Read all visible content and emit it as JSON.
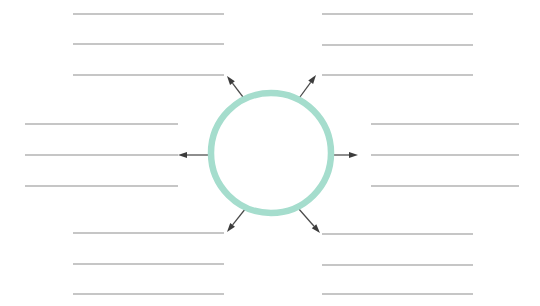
{
  "worksheet": {
    "title": "Blank radial brainstorming worksheet",
    "width": 540,
    "height": 306,
    "background_color": "#ffffff"
  },
  "center": {
    "shape_name": "center-circle",
    "cx": 271,
    "cy": 153,
    "r": 60,
    "stroke_color": "#a5ddcd",
    "stroke_width": 6.5,
    "fill": "none",
    "label": ""
  },
  "line_style": {
    "color": "#8d8d8d",
    "width": 1.1
  },
  "arrow_style": {
    "color": "#3c3c3c",
    "shaft_width": 1.25,
    "head_length": 9,
    "head_width": 6
  },
  "arrows": [
    {
      "name": "arrow-up-left",
      "x1": 246,
      "y1": 101,
      "x2": 227,
      "y2": 76,
      "direction": "up-left"
    },
    {
      "name": "arrow-up-right",
      "x1": 297,
      "y1": 101,
      "x2": 316,
      "y2": 75,
      "direction": "up-right"
    },
    {
      "name": "arrow-left",
      "x1": 211,
      "y1": 155,
      "x2": 178,
      "y2": 155,
      "direction": "left"
    },
    {
      "name": "arrow-right",
      "x1": 331,
      "y1": 155,
      "x2": 358,
      "y2": 155,
      "direction": "right"
    },
    {
      "name": "arrow-down-left",
      "x1": 246,
      "y1": 208,
      "x2": 227,
      "y2": 232,
      "direction": "down-left"
    },
    {
      "name": "arrow-down-right",
      "x1": 298,
      "y1": 208,
      "x2": 320,
      "y2": 233,
      "direction": "down-right"
    }
  ],
  "line_groups": [
    {
      "name": "lines-top-left",
      "position": "top-left",
      "x_start": 73,
      "x_end": 224,
      "lines": [
        {
          "name": "writing-line",
          "y": 14,
          "text": ""
        },
        {
          "name": "writing-line",
          "y": 44,
          "text": ""
        },
        {
          "name": "writing-line",
          "y": 75,
          "text": ""
        }
      ]
    },
    {
      "name": "lines-top-right",
      "position": "top-right",
      "x_start": 322,
      "x_end": 473,
      "lines": [
        {
          "name": "writing-line",
          "y": 14,
          "text": ""
        },
        {
          "name": "writing-line",
          "y": 45,
          "text": ""
        },
        {
          "name": "writing-line",
          "y": 75,
          "text": ""
        }
      ]
    },
    {
      "name": "lines-middle-left",
      "position": "middle-left",
      "x_start": 25,
      "x_end": 178,
      "lines": [
        {
          "name": "writing-line",
          "y": 124,
          "text": ""
        },
        {
          "name": "writing-line",
          "y": 155,
          "text": ""
        },
        {
          "name": "writing-line",
          "y": 186,
          "text": ""
        }
      ]
    },
    {
      "name": "lines-middle-right",
      "position": "middle-right",
      "x_start": 371,
      "x_end": 519,
      "lines": [
        {
          "name": "writing-line",
          "y": 124,
          "text": ""
        },
        {
          "name": "writing-line",
          "y": 155,
          "text": ""
        },
        {
          "name": "writing-line",
          "y": 186,
          "text": ""
        }
      ]
    },
    {
      "name": "lines-bottom-left",
      "position": "bottom-left",
      "x_start": 73,
      "x_end": 224,
      "lines": [
        {
          "name": "writing-line",
          "y": 233,
          "text": ""
        },
        {
          "name": "writing-line",
          "y": 264,
          "text": ""
        },
        {
          "name": "writing-line",
          "y": 294,
          "text": ""
        }
      ]
    },
    {
      "name": "lines-bottom-right",
      "position": "bottom-right",
      "x_start": 322,
      "x_end": 473,
      "lines": [
        {
          "name": "writing-line",
          "y": 234,
          "text": ""
        },
        {
          "name": "writing-line",
          "y": 265,
          "text": ""
        },
        {
          "name": "writing-line",
          "y": 294,
          "text": ""
        }
      ]
    }
  ]
}
